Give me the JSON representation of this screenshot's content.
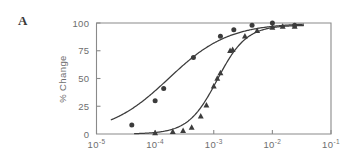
{
  "panel": {
    "label": "A"
  },
  "chart_data": {
    "type": "line",
    "title": "",
    "xlabel": "",
    "ylabel": "% Change",
    "xscale": "log",
    "xlim": [
      1e-05,
      0.1
    ],
    "ylim": [
      0,
      100
    ],
    "grid": false,
    "legend": "none",
    "x_ticks": [
      {
        "value": 1e-05,
        "base": "10",
        "exp": "-5"
      },
      {
        "value": 0.0001,
        "base": "10",
        "exp": "-4"
      },
      {
        "value": 0.001,
        "base": "10",
        "exp": "-3"
      },
      {
        "value": 0.01,
        "base": "10",
        "exp": "-2"
      },
      {
        "value": 0.1,
        "base": "10",
        "exp": "-1"
      }
    ],
    "y_ticks": [
      {
        "value": 0,
        "label": "0"
      },
      {
        "value": 25,
        "label": "25"
      },
      {
        "value": 50,
        "label": "50"
      },
      {
        "value": 75,
        "label": "75"
      },
      {
        "value": 100,
        "label": "100"
      }
    ],
    "series": [
      {
        "name": "circles",
        "marker": "circle",
        "color": "#3c3c3c",
        "points": [
          {
            "x": 4e-05,
            "y": 8
          },
          {
            "x": 0.0001,
            "y": 30
          },
          {
            "x": 0.00014,
            "y": 41
          },
          {
            "x": 0.00045,
            "y": 69
          },
          {
            "x": 0.0013,
            "y": 88
          },
          {
            "x": 0.0022,
            "y": 94
          },
          {
            "x": 0.0045,
            "y": 98
          },
          {
            "x": 0.01,
            "y": 100
          },
          {
            "x": 0.024,
            "y": 98
          }
        ],
        "fit_ec50": 0.00017,
        "fit_hill": 0.85,
        "fit_top": 100,
        "fit_bottom": 0
      },
      {
        "name": "triangles",
        "marker": "triangle",
        "color": "#3c3c3c",
        "points": [
          {
            "x": 0.0001,
            "y": 1
          },
          {
            "x": 0.0002,
            "y": 2
          },
          {
            "x": 0.0003,
            "y": 3
          },
          {
            "x": 0.00042,
            "y": 6
          },
          {
            "x": 0.0006,
            "y": 16
          },
          {
            "x": 0.00075,
            "y": 26
          },
          {
            "x": 0.001,
            "y": 43
          },
          {
            "x": 0.00115,
            "y": 50
          },
          {
            "x": 0.0013,
            "y": 55
          },
          {
            "x": 0.0019,
            "y": 75
          },
          {
            "x": 0.0021,
            "y": 76
          },
          {
            "x": 0.0034,
            "y": 88
          },
          {
            "x": 0.0055,
            "y": 93
          },
          {
            "x": 0.01,
            "y": 96
          },
          {
            "x": 0.015,
            "y": 97
          },
          {
            "x": 0.024,
            "y": 97
          }
        ],
        "fit_ec50": 0.00115,
        "fit_hill": 1.75,
        "fit_top": 98,
        "fit_bottom": 0
      }
    ]
  }
}
